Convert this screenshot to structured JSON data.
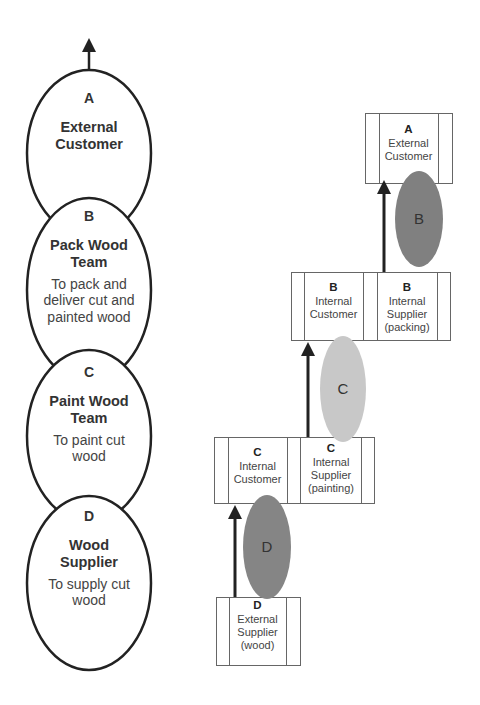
{
  "left_chain": {
    "nodes": [
      {
        "letter": "A",
        "title": "External Customer",
        "desc": ""
      },
      {
        "letter": "B",
        "title": "Pack Wood Team",
        "desc": "To pack and deliver cut and painted wood"
      },
      {
        "letter": "C",
        "title": "Paint Wood Team",
        "desc": "To paint cut wood"
      },
      {
        "letter": "D",
        "title": "Wood Supplier",
        "desc": "To supply cut wood"
      }
    ]
  },
  "right_chain": {
    "boxes": [
      {
        "cells": [
          {
            "letter": "A",
            "text": "External Customer"
          }
        ]
      },
      {
        "cells": [
          {
            "letter": "B",
            "text": "Internal Customer"
          },
          {
            "letter": "B",
            "text": "Internal Supplier (packing)"
          }
        ]
      },
      {
        "cells": [
          {
            "letter": "C",
            "text": "Internal Customer"
          },
          {
            "letter": "C",
            "text": "Internal Supplier (painting)"
          }
        ]
      },
      {
        "cells": [
          {
            "letter": "D",
            "text": "External Supplier (wood)"
          }
        ]
      }
    ],
    "process_ellipses": [
      {
        "letter": "B",
        "color": "#808080"
      },
      {
        "letter": "C",
        "color": "#c8c8c8"
      },
      {
        "letter": "D",
        "color": "#858585"
      }
    ]
  }
}
